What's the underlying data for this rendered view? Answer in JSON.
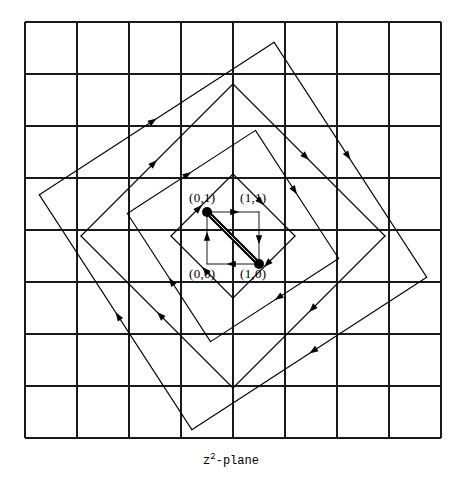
{
  "figure": {
    "caption_base": "z",
    "caption_exponent": "2",
    "caption_suffix": "-plane",
    "caption_full": "z2-plane",
    "colors": {
      "ink": "#000000",
      "grid": "#1a1a1a",
      "background": "#ffffff"
    },
    "grid": {
      "columns": 8,
      "rows": 8,
      "x0": 25,
      "y0": 22,
      "cell": 52,
      "line_width": 1.1,
      "border_width": 1.6
    },
    "unit_square": {
      "origin_x": 207,
      "origin_y": 264,
      "size": 52,
      "thick_diagonal_width": 5,
      "dot_radius": 5
    },
    "point_labels": [
      {
        "name": "label-0-1",
        "text": "(0,1)",
        "x": 189,
        "y": 190
      },
      {
        "name": "label-1-1",
        "text": "(1,1)",
        "x": 240,
        "y": 190
      },
      {
        "name": "label-0-0",
        "text": "(0,0)",
        "x": 189,
        "y": 266
      },
      {
        "name": "label-1-0",
        "text": "(1,0)",
        "x": 240,
        "y": 266
      }
    ],
    "diamonds": {
      "center_x": 233,
      "center_y": 236,
      "count": 4,
      "radii": [
        62,
        108,
        152,
        198
      ],
      "rotations_deg": [
        0,
        12,
        0,
        12
      ],
      "stroke_width": 1.1,
      "arrow_count_per_side": 1,
      "description": "Four nested rotated squares with arrowheads on each edge pointing outward around the center"
    },
    "arrow": {
      "head_length": 9,
      "head_half_width": 3.2
    }
  }
}
